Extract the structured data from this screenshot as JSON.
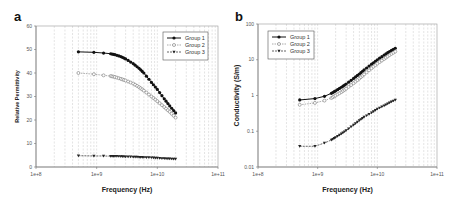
{
  "panels": [
    {
      "label": "a"
    },
    {
      "label": "b"
    }
  ],
  "chart_data": [
    {
      "type": "line",
      "panel": "a",
      "title": "",
      "xlabel": "Frequency (Hz)",
      "ylabel": "Relative Permittivity",
      "xscale": "log",
      "xlim": [
        100000000.0,
        100000000000.0
      ],
      "ylim": [
        0,
        60
      ],
      "xticks": [
        "1e+8",
        "1e+9",
        "1e+10",
        "1e+11"
      ],
      "yticks": [
        "0",
        "10",
        "20",
        "30",
        "40",
        "50",
        "60"
      ],
      "grid": "vertical dashed minor/major",
      "legend_position": "upper right",
      "x": [
        500000000.0,
        900000000.0,
        1300000000.0,
        1700000000.0,
        2000000000.0,
        2500000000.0,
        3000000000.0,
        4000000000.0,
        5000000000.0,
        6000000000.0,
        8000000000.0,
        10000000000.0,
        13000000000.0,
        16000000000.0,
        20000000000.0
      ],
      "series": [
        {
          "name": "Group 1",
          "marker": "filled-circle",
          "values": [
            49,
            48.8,
            48.5,
            48.2,
            47.8,
            47,
            46,
            44,
            42,
            40,
            36,
            33,
            29,
            26,
            23
          ]
        },
        {
          "name": "Group 2",
          "marker": "open-circle",
          "values": [
            40,
            39.5,
            39,
            38.7,
            38.3,
            37.5,
            36.8,
            35.5,
            34,
            32.5,
            30,
            28,
            25.5,
            23.5,
            21
          ]
        },
        {
          "name": "Group 3",
          "marker": "filled-triangle",
          "values": [
            4.8,
            4.7,
            4.7,
            4.6,
            4.6,
            4.5,
            4.4,
            4.3,
            4.2,
            4.1,
            4.0,
            3.8,
            3.6,
            3.5,
            3.4
          ]
        }
      ]
    },
    {
      "type": "line",
      "panel": "b",
      "title": "",
      "xlabel": "Frequency (Hz)",
      "ylabel": "Conductivity (S/m)",
      "xscale": "log",
      "yscale": "log",
      "xlim": [
        100000000.0,
        100000000000.0
      ],
      "ylim": [
        0.01,
        100
      ],
      "xticks": [
        "1e+8",
        "1e+9",
        "1e+10",
        "1e+11"
      ],
      "yticks": [
        "0.01",
        "0.1",
        "1",
        "10",
        "100"
      ],
      "grid": "vertical dashed minor/major",
      "legend_position": "upper left",
      "x": [
        500000000.0,
        900000000.0,
        1300000000.0,
        1700000000.0,
        2000000000.0,
        2500000000.0,
        3000000000.0,
        4000000000.0,
        5000000000.0,
        6000000000.0,
        8000000000.0,
        10000000000.0,
        13000000000.0,
        16000000000.0,
        20000000000.0
      ],
      "series": [
        {
          "name": "Group 1",
          "marker": "filled-circle",
          "values": [
            0.75,
            0.82,
            0.95,
            1.15,
            1.35,
            1.7,
            2.1,
            3.0,
            4.0,
            5.2,
            7.5,
            10,
            13.5,
            17,
            21
          ]
        },
        {
          "name": "Group 2",
          "marker": "open-circle",
          "values": [
            0.55,
            0.62,
            0.72,
            0.85,
            1.0,
            1.25,
            1.55,
            2.2,
            3.0,
            3.9,
            5.8,
            7.8,
            10.5,
            13.5,
            17
          ]
        },
        {
          "name": "Group 3",
          "marker": "filled-triangle",
          "values": [
            0.038,
            0.038,
            0.047,
            0.057,
            0.067,
            0.085,
            0.105,
            0.15,
            0.2,
            0.25,
            0.33,
            0.42,
            0.52,
            0.63,
            0.75
          ]
        }
      ]
    }
  ]
}
